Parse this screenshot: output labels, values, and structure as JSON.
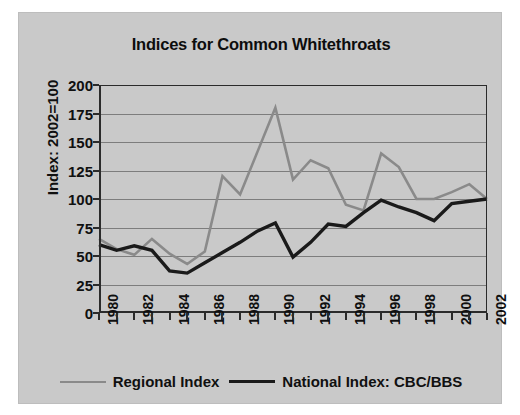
{
  "chart_data": {
    "type": "line",
    "title": "Indices for Common Whitethroats",
    "xlabel": "",
    "ylabel": "Index: 2002=100",
    "ylim": [
      0,
      200
    ],
    "ytick_step": 25,
    "yticks": [
      "200",
      "175",
      "150",
      "125",
      "100",
      "75",
      "50",
      "25",
      "0"
    ],
    "xlim": [
      1980,
      2002
    ],
    "grid": true,
    "legend_position": "bottom",
    "x": [
      1980,
      1981,
      1982,
      1983,
      1984,
      1985,
      1986,
      1987,
      1988,
      1989,
      1990,
      1991,
      1992,
      1993,
      1994,
      1995,
      1996,
      1997,
      1998,
      1999,
      2000,
      2001,
      2002
    ],
    "xtick_labels": [
      "1980",
      "",
      "1982",
      "",
      "1984",
      "",
      "1986",
      "",
      "1988",
      "",
      "1990",
      "",
      "1992",
      "",
      "1994",
      "",
      "1996",
      "",
      "1998",
      "",
      "2000",
      "",
      "2002"
    ],
    "series": [
      {
        "name": "Regional Index",
        "color": "#8a8a8a",
        "width": 2.6,
        "values": [
          65,
          56,
          51,
          65,
          52,
          43,
          54,
          120,
          104,
          142,
          180,
          117,
          134,
          127,
          95,
          90,
          140,
          128,
          100,
          100,
          106,
          113,
          100
        ]
      },
      {
        "name": "National Index: CBC/BBS",
        "color": "#1a1a1a",
        "width": 3.4,
        "values": [
          60,
          55,
          59,
          55,
          37,
          35,
          44,
          53,
          62,
          72,
          79,
          49,
          62,
          78,
          76,
          88,
          99,
          93,
          88,
          81,
          96,
          98,
          100
        ]
      }
    ]
  },
  "legend": {
    "items": [
      {
        "label": "Regional Index",
        "color": "#8a8a8a"
      },
      {
        "label": "National Index: CBC/BBS",
        "color": "#1a1a1a"
      }
    ]
  },
  "colors": {
    "plate_background": "#c9c9c9",
    "axis": "#2b2b2b",
    "gridline": "#7d7d7d",
    "text": "#101010",
    "regional_series": "#8a8a8a",
    "national_series": "#1a1a1a"
  }
}
